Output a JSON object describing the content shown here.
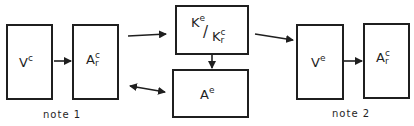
{
  "diagram": {
    "boxes": {
      "v_c": {
        "base": "V",
        "sup": "c"
      },
      "a_r_c_left": {
        "base": "A",
        "sup": "c",
        "sub": "r"
      },
      "k_ratio": {
        "num_base": "K",
        "num_sup": "e",
        "slash": "/",
        "den_base": "K",
        "den_sup": "c",
        "den_sub": "r"
      },
      "a_e": {
        "base": "A",
        "sup": "e"
      },
      "v_e": {
        "base": "V",
        "sup": "e"
      },
      "a_r_c_right": {
        "base": "A",
        "sup": "c",
        "sub": "r"
      }
    },
    "notes": {
      "note1": "note 1",
      "note2": "note 2"
    },
    "colors": {
      "stroke": "#1f1f1f",
      "background": "#ffffff"
    }
  }
}
